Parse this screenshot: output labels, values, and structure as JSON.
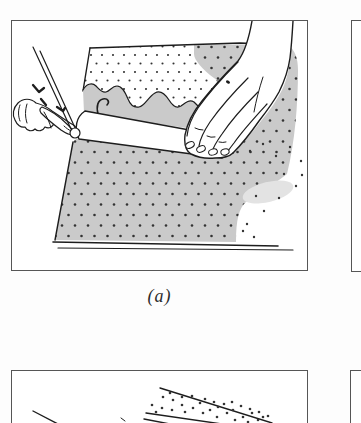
{
  "page": {
    "caption_a": "(a)",
    "panels": [
      {
        "id": "a",
        "label": "(a)",
        "alt": "Two hands rolling an ink brayer across a stippled sheet; gray inked area surrounds an uninked dotted strip above the roller"
      },
      {
        "id": "b",
        "label": "",
        "alt": "Right-hand neighboring panel, mostly cropped off the image edge"
      },
      {
        "id": "c",
        "label": "",
        "alt": "Lower panel, cropped: diagonal ruled lines with a band of stipple dots"
      },
      {
        "id": "d",
        "label": "",
        "alt": "Lower-right neighboring panel, mostly cropped off the image edge"
      }
    ],
    "colors": {
      "background": "#fdfdfd",
      "panel_bg": "#ffffff",
      "panel_border": "#565656",
      "ink_line": "#1d1d1d",
      "shade_gray": "#cacaca",
      "soft_shadow": "#e3e3e3",
      "dot": "#333333",
      "caption_color": "#2b2b2b"
    }
  }
}
